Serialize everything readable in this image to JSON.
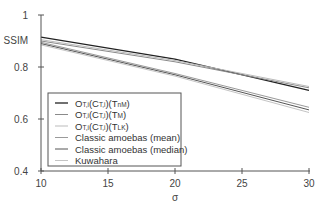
{
  "chart_data": {
    "type": "line",
    "title": "",
    "xlabel": "σ",
    "ylabel": "SSIM",
    "xlim": [
      10,
      30
    ],
    "ylim": [
      0.4,
      1.0
    ],
    "x_ticks": [
      "10",
      "15",
      "20",
      "25",
      "30"
    ],
    "y_ticks": [
      "0.4",
      "0.6",
      "0.8",
      "1"
    ],
    "grid": false,
    "legend_position": "lower-left inside",
    "x": [
      10,
      20,
      30
    ],
    "series": [
      {
        "name": "O_T,i(C_T,i)(T_nM)",
        "label_main": "O",
        "sub1": "T,i",
        "mid": "(C",
        "sub2": "T,i",
        "mid2": ")(T",
        "sub3": "nM",
        "end": ")",
        "color": "#222222",
        "width": 1.3,
        "values": [
          0.915,
          0.83,
          0.71
        ]
      },
      {
        "name": "O_T,i(C_T,i)(T_M)",
        "label_main": "O",
        "sub1": "T,i",
        "mid": "(C",
        "sub2": "T,i",
        "mid2": ")(T",
        "sub3": "M",
        "end": ")",
        "color": "#8a8a8a",
        "width": 1,
        "values": [
          0.9,
          0.82,
          0.72
        ]
      },
      {
        "name": "O_T,i(C_T,i)(T_LK)",
        "label_main": "O",
        "sub1": "T,i",
        "mid": "(C",
        "sub2": "T,i",
        "mid2": ")(T",
        "sub3": "LK",
        "end": ")",
        "color": "#bbbbbb",
        "width": 1,
        "values": [
          0.905,
          0.825,
          0.725
        ]
      },
      {
        "name": "Classic amoebas (mean)",
        "color": "#9a9a9a",
        "width": 1,
        "values": [
          0.895,
          0.775,
          0.645
        ]
      },
      {
        "name": "Classic amoebas (median)",
        "color": "#555555",
        "width": 1,
        "values": [
          0.89,
          0.77,
          0.635
        ]
      },
      {
        "name": "Kuwahara",
        "color": "#c4c4c4",
        "width": 1,
        "values": [
          0.885,
          0.765,
          0.625
        ]
      }
    ]
  }
}
